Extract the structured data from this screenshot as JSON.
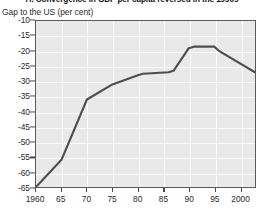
{
  "chart_data": {
    "type": "line",
    "title": "A. Convergence in GDP per capita reversed in the 1990s",
    "subtitle": "Gap to the US (per cent)",
    "xlabel": "",
    "ylabel": "Gap to the US (per cent)",
    "xlim": [
      1960,
      2003
    ],
    "ylim": [
      -65,
      -10
    ],
    "yticks": [
      -10,
      -15,
      -20,
      -25,
      -30,
      -35,
      -40,
      -45,
      -50,
      -55,
      -60,
      -65
    ],
    "ytick_labels": [
      "-10",
      "-15",
      "-20",
      "-25",
      "-30",
      "-35",
      "-40",
      "-45",
      "-50",
      "-55",
      "-60",
      "-65"
    ],
    "xticks": [
      1960,
      1965,
      1970,
      1975,
      1980,
      1985,
      1990,
      1995,
      2000
    ],
    "xtick_labels": [
      "1960",
      "65",
      "70",
      "75",
      "80",
      "85",
      "90",
      "95",
      "2000"
    ],
    "grid": true,
    "legend": false,
    "series": [
      {
        "name": "Gap to the US (per cent)",
        "color": "#4d4d4d",
        "x": [
          1960,
          1965,
          1970,
          1975,
          1980,
          1981,
          1986,
          1987,
          1990,
          1991,
          1995,
          1996,
          2003
        ],
        "values": [
          -65,
          -56,
          -36,
          -31,
          -28,
          -27.5,
          -27,
          -26.5,
          -19,
          -18.5,
          -18.5,
          -20,
          -27
        ]
      }
    ]
  },
  "axes": {
    "y_unit_caption": "Gap to the US (per cent)"
  }
}
